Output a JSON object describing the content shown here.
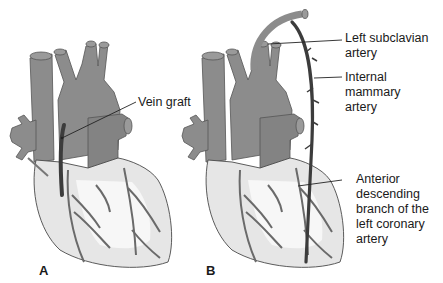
{
  "diagram": {
    "panels": [
      {
        "id": "A",
        "letter": "A",
        "description": "Coronary bypass with vein graft"
      },
      {
        "id": "B",
        "letter": "B",
        "description": "Coronary bypass with internal mammary artery"
      }
    ],
    "labels": {
      "vein_graft": "Vein graft",
      "left_subclavian": "Left subclavian\nartery",
      "internal_mammary": "Internal\nmammary\nartery",
      "anterior_descending": "Anterior\ndescending\nbranch of the\nleft coronary\nartery"
    },
    "colors": {
      "vessel_gray": "#8c8c8c",
      "vessel_shade": "#7a7a7a",
      "heart_light": "#e6e6e6",
      "heart_highlight": "#f7f7f7",
      "graft_dark": "#3c3c3c",
      "outline": "#4a4a4a",
      "text": "#1a1a1a"
    }
  }
}
